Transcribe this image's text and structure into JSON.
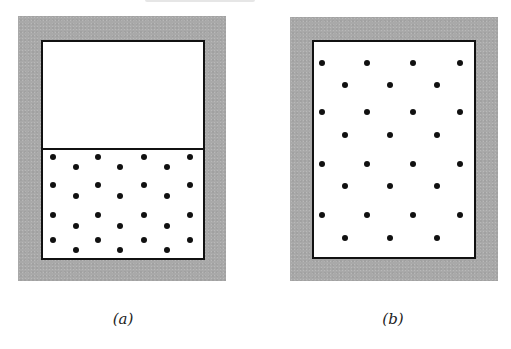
{
  "figure": {
    "panels": [
      {
        "id": "a",
        "label": "(a)",
        "description": "Container with a partition; gas particles confined to the lower half, upper half empty"
      },
      {
        "id": "b",
        "label": "(b)",
        "description": "Partition removed; gas particles spread throughout the whole container"
      }
    ],
    "colors": {
      "frame": "#a9a9a9",
      "wall": "#111111",
      "particle": "#111111",
      "interior": "#ffffff"
    },
    "particle_counts": {
      "a": 28,
      "b": 28
    }
  }
}
